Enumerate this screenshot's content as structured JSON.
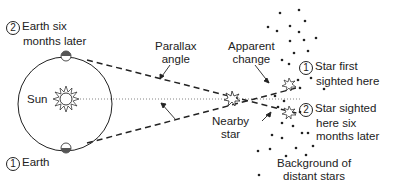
{
  "diagram": {
    "labels": {
      "earth_later_num": "2",
      "earth_later_line1": "Earth six",
      "earth_later_line2": "months later",
      "earth_num": "1",
      "earth": "Earth",
      "sun": "Sun",
      "parallax_line1": "Parallax",
      "parallax_line2": "angle",
      "apparent_line1": "Apparent",
      "apparent_line2": "change",
      "nearby_line1": "Nearby",
      "nearby_line2": "star",
      "star_first_num": "1",
      "star_first_line1": "Star first",
      "star_first_line2": "sighted here",
      "star_later_num": "2",
      "star_later_line1": "Star sighted",
      "star_later_line2": "here six",
      "star_later_line3": "months later",
      "background_line1": "Background of",
      "background_line2": "distant stars"
    },
    "icons": [
      "sun-icon",
      "earth-icon",
      "nearby-star-icon",
      "apparent-star-icon",
      "distant-star-dot"
    ],
    "colors": {
      "line": "#222222",
      "background": "#ffffff"
    }
  }
}
